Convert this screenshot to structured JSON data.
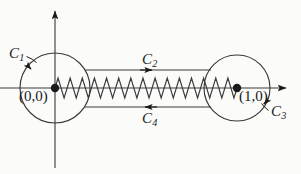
{
  "figure": {
    "background_color": "#fbfbfa",
    "ink_color": "#1a1a1a"
  },
  "axes": {
    "x_axis": {
      "name": "real-axis",
      "from_x": 0,
      "to_x": 291,
      "y": 88,
      "arrow": "right"
    },
    "y_axis": {
      "name": "imaginary-axis",
      "x": 55,
      "from_y": 168,
      "to_y": 5,
      "arrow": "up"
    }
  },
  "points": [
    {
      "label": "(0,0)",
      "x": 55,
      "y": 88
    },
    {
      "label": "(1,0)",
      "x": 237,
      "y": 88
    }
  ],
  "contours": [
    {
      "id": "C1",
      "base": "C",
      "subscript": "1",
      "shape": "circle",
      "center_x": 55,
      "center_y": 88,
      "radius": 35,
      "direction": "clockwise",
      "arrow_at": "upper-left"
    },
    {
      "id": "C2",
      "base": "C",
      "subscript": "2",
      "shape": "segment",
      "y": 70,
      "from_x": 85,
      "to_x": 211,
      "direction": "rightward",
      "arrow_at": "middle"
    },
    {
      "id": "C3",
      "base": "C",
      "subscript": "3",
      "shape": "circle",
      "center_x": 237,
      "center_y": 88,
      "radius": 33,
      "direction": "clockwise",
      "arrow_at": "lower-right"
    },
    {
      "id": "C4",
      "base": "C",
      "subscript": "4",
      "shape": "segment",
      "y": 107,
      "from_x": 85,
      "to_x": 211,
      "direction": "leftward",
      "arrow_at": "middle"
    }
  ],
  "branch_cut": {
    "name": "branch-cut-zigzag",
    "from_x": 55,
    "to_x": 237,
    "center_y": 88,
    "amplitude": 10,
    "cycles": 15
  },
  "labels": {
    "c1": {
      "base": "C",
      "sub": "1"
    },
    "c2": {
      "base": "C",
      "sub": "2"
    },
    "c3": {
      "base": "C",
      "sub": "3"
    },
    "c4": {
      "base": "C",
      "sub": "4"
    },
    "origin": "(0,0)",
    "unit": "(1,0)"
  }
}
